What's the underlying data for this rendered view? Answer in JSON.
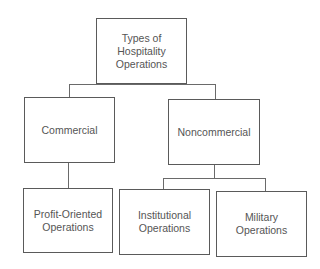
{
  "diagram": {
    "type": "org-chart",
    "root": {
      "label": "Types of\nHospitality\nOperations"
    },
    "level1": [
      {
        "label": "Commercial"
      },
      {
        "label": "Noncommercial"
      }
    ],
    "level2": [
      {
        "label": "Profit-Oriented\nOperations",
        "parent": "Commercial"
      },
      {
        "label": "Institutional\nOperations",
        "parent": "Noncommercial"
      },
      {
        "label": "Military\nOperations",
        "parent": "Noncommercial"
      }
    ],
    "colors": {
      "border": "#5a5a5a",
      "text": "#555555",
      "background": "#ffffff"
    }
  }
}
